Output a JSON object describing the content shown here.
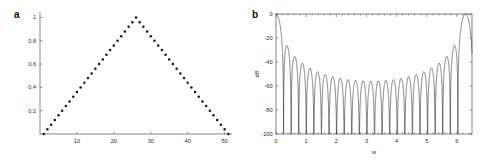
{
  "figure": {
    "background": "#ffffff",
    "ink": "#141414"
  },
  "panels": [
    {
      "id": "a",
      "letter": "a",
      "chart_data": {
        "type": "scatter",
        "title": "",
        "subtitle": "",
        "xlabel": "",
        "ylabel": "",
        "xlim": [
          0,
          52
        ],
        "ylim": [
          0,
          1.03
        ],
        "xticks": [
          10,
          20,
          30,
          40,
          50
        ],
        "xticklabels": [
          "10",
          "20",
          "30",
          "40",
          "50"
        ],
        "yticks": [
          0.2,
          0.4,
          0.6,
          0.8,
          1
        ],
        "yticklabels": [
          "0.2",
          "0.4",
          "0.6",
          "0.8",
          "1"
        ],
        "grid": false,
        "legend": "none",
        "marker": "dot",
        "series": [
          {
            "name": "triangular (Bartlett) window, N = 51",
            "x": [
              1,
              2,
              3,
              4,
              5,
              6,
              7,
              8,
              9,
              10,
              11,
              12,
              13,
              14,
              15,
              16,
              17,
              18,
              19,
              20,
              21,
              22,
              23,
              24,
              25,
              26,
              27,
              28,
              29,
              30,
              31,
              32,
              33,
              34,
              35,
              36,
              37,
              38,
              39,
              40,
              41,
              42,
              43,
              44,
              45,
              46,
              47,
              48,
              49,
              50,
              51
            ],
            "values": [
              0,
              0.04,
              0.08,
              0.12,
              0.16,
              0.2,
              0.24,
              0.28,
              0.32,
              0.36,
              0.4,
              0.44,
              0.48,
              0.52,
              0.56,
              0.6,
              0.64,
              0.68,
              0.72,
              0.76,
              0.8,
              0.84,
              0.88,
              0.92,
              0.96,
              1,
              0.96,
              0.92,
              0.88,
              0.84,
              0.8,
              0.76,
              0.72,
              0.68,
              0.64,
              0.6,
              0.56,
              0.52,
              0.48,
              0.44,
              0.4,
              0.36,
              0.32,
              0.28,
              0.24,
              0.2,
              0.16,
              0.12,
              0.08,
              0.04,
              0
            ]
          }
        ]
      }
    },
    {
      "id": "b",
      "letter": "b",
      "chart_data": {
        "type": "line",
        "title": "",
        "subtitle": "",
        "xlabel": "w",
        "ylabel": "dB",
        "xlim": [
          0,
          6.5
        ],
        "ylim": [
          -100,
          0
        ],
        "xticks": [
          0,
          1,
          2,
          3,
          4,
          5,
          6
        ],
        "xticklabels": [
          "0",
          "1",
          "2",
          "3",
          "4",
          "5",
          "6"
        ],
        "yticks": [
          0,
          -20,
          -40,
          -60,
          -80,
          -100
        ],
        "yticklabels": [
          "0",
          "-20",
          "-40",
          "-60",
          "-80",
          "-100"
        ],
        "grid": false,
        "legend": "none",
        "frame": true,
        "series": [
          {
            "name": "magnitude spectrum of triangular window (dB)",
            "description": "20*log10(|W(w)|) for a 51-point Bartlett window, mainlobe at w=0 and w=2*pi, symmetric about w=pi",
            "window_length": 51,
            "mainlobe_peak_db": 0,
            "first_sidelobe_db": -27,
            "floor_db": -100,
            "sidelobe_envelope_min_db": -63
          }
        ]
      }
    }
  ]
}
